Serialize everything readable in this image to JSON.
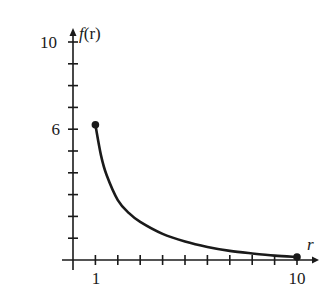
{
  "chart_data": {
    "type": "line",
    "title": "",
    "xlabel": "r",
    "ylabel": "f(r)",
    "xlim": [
      0,
      10.6
    ],
    "ylim": [
      0,
      10.5
    ],
    "x_tick_labels": [
      "1",
      "10"
    ],
    "y_tick_labels": [
      "6",
      "10"
    ],
    "x_ticks": [
      1,
      2,
      3,
      4,
      5,
      6,
      7,
      8,
      9,
      10
    ],
    "y_ticks": [
      1,
      2,
      3,
      4,
      5,
      6,
      7,
      8,
      9,
      10
    ],
    "grid": false,
    "legend": null,
    "series": [
      {
        "name": "f(r)",
        "x": [
          1,
          1.25,
          1.5,
          2,
          2.5,
          3,
          4,
          5,
          6,
          7,
          8,
          9,
          10
        ],
        "y": [
          6.2,
          4.8,
          3.9,
          2.75,
          2.15,
          1.75,
          1.2,
          0.85,
          0.6,
          0.42,
          0.3,
          0.2,
          0.14
        ],
        "endpoints": [
          {
            "x": 1,
            "y": 6.2,
            "marker": "filled-dot"
          },
          {
            "x": 10,
            "y": 0.14,
            "marker": "filled-dot"
          }
        ]
      }
    ],
    "colors": {
      "axis": "#1a1a1a",
      "curve": "#1a1a1a"
    }
  },
  "axis_labels": {
    "x": "r",
    "y_f": "f",
    "y_paren": "(r)"
  },
  "tick_labels": {
    "x_1": "1",
    "x_10": "10",
    "y_6": "6",
    "y_10": "10"
  }
}
